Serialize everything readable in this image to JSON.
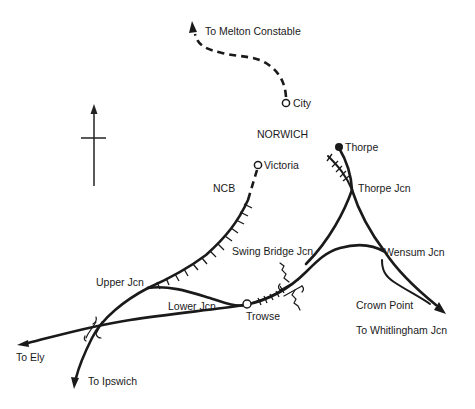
{
  "diagram": {
    "type": "railway-junction-map",
    "title": "NORWICH",
    "colors": {
      "line": "#1a1a1a",
      "background": "#ffffff"
    },
    "stations": [
      {
        "id": "city",
        "label": "City",
        "marker": "open-circle"
      },
      {
        "id": "victoria",
        "label": "Victoria",
        "marker": "open-circle"
      },
      {
        "id": "thorpe",
        "label": "Thorpe",
        "marker": "filled-circle"
      },
      {
        "id": "trowse",
        "label": "Trowse",
        "marker": "open-circle"
      }
    ],
    "junctions": [
      {
        "id": "thorpe-jcn",
        "label": "Thorpe Jcn"
      },
      {
        "id": "wensum-jcn",
        "label": "Wensum Jcn"
      },
      {
        "id": "swing-bridge-jcn",
        "label": "Swing Bridge Jcn"
      },
      {
        "id": "upper-jcn",
        "label": "Upper Jcn"
      },
      {
        "id": "lower-jcn",
        "label": "Lower Jcn"
      },
      {
        "id": "crown-point",
        "label": "Crown Point"
      }
    ],
    "destinations": [
      {
        "id": "melton-constable",
        "label": "To Melton Constable"
      },
      {
        "id": "whitlingham-jcn",
        "label": "To Whitlingham Jcn"
      },
      {
        "id": "ely",
        "label": "To Ely"
      },
      {
        "id": "ipswich",
        "label": "To Ipswich"
      }
    ],
    "other_labels": {
      "ncb": "NCB"
    },
    "compass": {
      "direction": "north-up"
    },
    "legend_notes": {
      "dashed": "closed / former line",
      "hatched": "freight-only / siding"
    }
  }
}
